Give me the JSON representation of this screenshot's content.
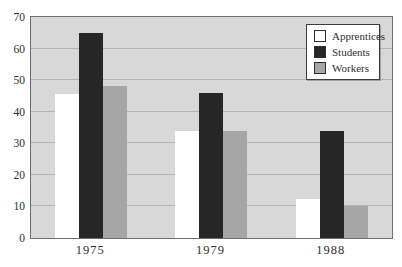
{
  "chart_data": {
    "type": "bar",
    "categories": [
      "1975",
      "1979",
      "1988"
    ],
    "series": [
      {
        "name": "Apprentices",
        "color": "#ffffff",
        "values": [
          45.5,
          34,
          12.5
        ]
      },
      {
        "name": "Students",
        "color": "#262626",
        "values": [
          65,
          46,
          34
        ]
      },
      {
        "name": "Workers",
        "color": "#a6a6a6",
        "values": [
          48,
          34,
          10
        ]
      }
    ],
    "ylim": [
      0,
      70
    ],
    "yticks": [
      0,
      10,
      20,
      30,
      40,
      50,
      60,
      70
    ],
    "grid": true,
    "legend_position": "top-right",
    "colors": {
      "plot_background": "#d8d8d8",
      "gridline": "#b5b5b5",
      "plot_border": "#6e6e6e",
      "text": "#2e2e2e",
      "legend_border": "#3c3c3c"
    }
  }
}
